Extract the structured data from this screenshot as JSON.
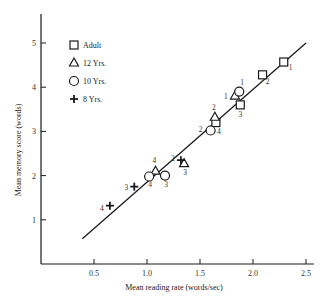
{
  "chart_data": {
    "type": "scatter",
    "title": "",
    "xlabel": "Mean reading rate (words/sec)",
    "ylabel": "Mean memory score (words)",
    "xlim": [
      0,
      2.6
    ],
    "ylim": [
      0,
      5.7
    ],
    "xticks": [
      0.5,
      1.0,
      1.5,
      2.0,
      2.5
    ],
    "xtick_labels": [
      "0.5",
      "1.0",
      "1.5",
      "2.0",
      "2.5"
    ],
    "yticks": [
      1,
      2,
      3,
      4,
      5
    ],
    "ytick_labels": [
      "1",
      "2",
      "3",
      "4",
      "5"
    ],
    "grid": false,
    "legend_position": "upper-left",
    "legend": [
      {
        "name": "Adult",
        "marker": "square"
      },
      {
        "name": "12 Yrs.",
        "marker": "triangle"
      },
      {
        "name": "10 Yrs.",
        "marker": "circle"
      },
      {
        "name": "8 Yrs.",
        "marker": "plus"
      }
    ],
    "series": [
      {
        "name": "Adult",
        "marker": "square",
        "points": [
          {
            "x": 2.29,
            "y": 4.57,
            "label": "1"
          },
          {
            "x": 2.09,
            "y": 4.28,
            "label": "2"
          },
          {
            "x": 1.88,
            "y": 3.6,
            "label": "3"
          },
          {
            "x": 1.65,
            "y": 3.2,
            "label": "4"
          }
        ]
      },
      {
        "name": "12 Yrs.",
        "marker": "triangle",
        "points": [
          {
            "x": 1.83,
            "y": 3.8,
            "label": "1"
          },
          {
            "x": 1.64,
            "y": 3.32,
            "label": "2"
          },
          {
            "x": 1.35,
            "y": 2.27,
            "label": "3"
          },
          {
            "x": 1.08,
            "y": 2.1,
            "label": "4"
          }
        ]
      },
      {
        "name": "10 Yrs.",
        "marker": "circle",
        "points": [
          {
            "x": 1.87,
            "y": 3.9,
            "label": "1"
          },
          {
            "x": 1.6,
            "y": 3.02,
            "label": "2"
          },
          {
            "x": 1.17,
            "y": 2.0,
            "label": "3"
          },
          {
            "x": 1.02,
            "y": 1.98,
            "label": "4"
          }
        ]
      },
      {
        "name": "8 Yrs.",
        "marker": "plus",
        "points": [
          {
            "x": 1.32,
            "y": 2.35,
            "label": "2"
          },
          {
            "x": 0.88,
            "y": 1.75,
            "label": "3"
          },
          {
            "x": 0.65,
            "y": 1.32,
            "label": "4"
          }
        ]
      }
    ],
    "regression_line": {
      "x1": 0.39,
      "y1": 0.57,
      "x2": 2.5,
      "y2": 5.0
    }
  }
}
